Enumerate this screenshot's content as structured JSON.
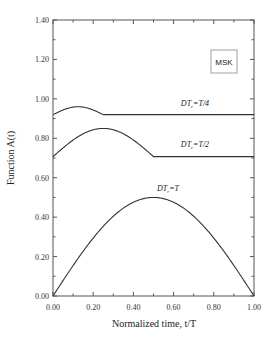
{
  "chart_data": {
    "type": "line",
    "title": "",
    "xlabel": "Normalized time,  t/T",
    "ylabel": "Function A(t)",
    "xlim": [
      0,
      1
    ],
    "ylim": [
      0,
      1.4
    ],
    "xticks": [
      "0.00",
      "0.20",
      "0.40",
      "0.60",
      "0.80",
      "1.00"
    ],
    "yticks": [
      "0.00",
      "0.20",
      "0.40",
      "0.60",
      "0.80",
      "1.00",
      "1.20",
      "1.40"
    ],
    "grid": false,
    "legend_box": "MSK",
    "series": [
      {
        "name": "DT_r=T/4",
        "x": [
          0,
          0.0625,
          0.125,
          0.1875,
          0.25,
          1.0
        ],
        "values": [
          0.92,
          0.95,
          0.96,
          0.95,
          0.92,
          0.92
        ]
      },
      {
        "name": "DT_r=T/2",
        "x": [
          0,
          0.125,
          0.25,
          0.375,
          0.5,
          1.0
        ],
        "values": [
          0.707,
          0.8,
          0.85,
          0.8,
          0.707,
          0.707
        ]
      },
      {
        "name": "DT_r=T",
        "x": [
          0,
          0.1,
          0.2,
          0.3,
          0.4,
          0.5,
          0.6,
          0.7,
          0.8,
          0.9,
          1.0
        ],
        "values": [
          0,
          0.155,
          0.294,
          0.405,
          0.476,
          0.5,
          0.476,
          0.405,
          0.294,
          0.155,
          0
        ]
      }
    ],
    "annotations": [
      "DT_r=T/4",
      "DT_r=T/2",
      "DT_r=T"
    ]
  },
  "labels": {
    "xlabel": "Normalized time,  t/T",
    "ylabel": "Function A(t)",
    "msk": "MSK",
    "ann_t4": "DT_r=T/4",
    "ann_t2": "DT_r=T/2",
    "ann_t": "DT_r=T"
  }
}
